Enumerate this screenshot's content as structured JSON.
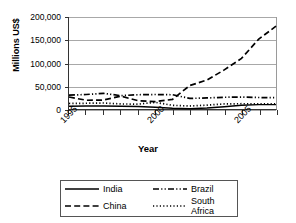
{
  "chart_data": {
    "type": "line",
    "title": "",
    "xlabel": "Year",
    "ylabel": "Millions US$",
    "x": [
      1995,
      1996,
      1997,
      1998,
      1999,
      2000,
      2001,
      2002,
      2003,
      2004,
      2005,
      2006,
      2007
    ],
    "xlim": [
      1995,
      2007
    ],
    "ylim": [
      0,
      200000
    ],
    "ytick_labels": [
      "200,000",
      "150,000",
      "100,000",
      "50,000",
      "0"
    ],
    "ytick_values": [
      200000,
      150000,
      100000,
      50000,
      0
    ],
    "xtick_labels": [
      "1995",
      "2000",
      "2005"
    ],
    "xtick_values": [
      1995,
      2000,
      2005
    ],
    "grid": "horizontal",
    "legend_position": "below",
    "series": [
      {
        "name": "India",
        "style": "solid",
        "values": [
          6000,
          6500,
          6500,
          6200,
          5200,
          4000,
          1500,
          500,
          2000,
          5000,
          8000,
          9500,
          9500
        ]
      },
      {
        "name": "China",
        "style": "dashed",
        "values": [
          26000,
          19000,
          19500,
          28000,
          18000,
          16000,
          21000,
          51000,
          63000,
          85000,
          110000,
          152000,
          180000
        ]
      },
      {
        "name": "Brazil",
        "style": "dashdotdot",
        "values": [
          30000,
          31500,
          34000,
          29000,
          31000,
          31500,
          31000,
          23000,
          24000,
          25500,
          26000,
          25000,
          24500
        ]
      },
      {
        "name": "South Africa",
        "style": "dotted",
        "values": [
          12000,
          12500,
          13000,
          11000,
          10500,
          14500,
          8000,
          6500,
          8500,
          11000,
          11500,
          11000,
          11000
        ]
      }
    ]
  },
  "legend": {
    "items": [
      {
        "label": "India",
        "style": "solid"
      },
      {
        "label": "Brazil",
        "style": "dashdotdot"
      },
      {
        "label": "China",
        "style": "dashed"
      },
      {
        "label": "South Africa",
        "style": "dotted"
      }
    ]
  }
}
